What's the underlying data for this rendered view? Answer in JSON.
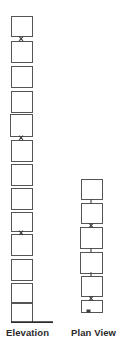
{
  "figure": {
    "type": "engineering-elevation-plan-diagram",
    "background_color": "#ffffff",
    "stroke_color": "#555555",
    "connector_color": "#3a3a3a",
    "label_color": "#2b2b2b",
    "width": 118,
    "height": 343
  },
  "columns": [
    {
      "id": "elevation",
      "label": "Elevation",
      "label_x": 6,
      "label_y": 327,
      "box_count": 13,
      "ground_line": {
        "x1": 11,
        "x2": 53,
        "y": 322,
        "width": 1.6
      },
      "boxes": [
        {
          "x": 11,
          "y": 16,
          "w": 21,
          "h": 20
        },
        {
          "x": 11,
          "y": 41,
          "w": 21,
          "h": 21
        },
        {
          "x": 11,
          "y": 66,
          "w": 21,
          "h": 21
        },
        {
          "x": 11,
          "y": 91,
          "w": 21,
          "h": 21
        },
        {
          "x": 11,
          "y": 114,
          "w": 22,
          "h": 22
        },
        {
          "x": 11,
          "y": 140,
          "w": 21,
          "h": 21
        },
        {
          "x": 11,
          "y": 164,
          "w": 21,
          "h": 21
        },
        {
          "x": 11,
          "y": 188,
          "w": 21,
          "h": 21
        },
        {
          "x": 11,
          "y": 212,
          "w": 21,
          "h": 19
        },
        {
          "x": 11,
          "y": 234,
          "w": 21,
          "h": 21
        },
        {
          "x": 11,
          "y": 259,
          "w": 21,
          "h": 21
        },
        {
          "x": 11,
          "y": 283,
          "w": 21,
          "h": 19
        },
        {
          "x": 11,
          "y": 303,
          "w": 21,
          "h": 19
        }
      ],
      "connectors": [
        {
          "x": 21,
          "y": 38
        },
        {
          "x": 21,
          "y": 137
        },
        {
          "x": 21,
          "y": 232
        }
      ]
    },
    {
      "id": "plan-view",
      "label": "Plan View",
      "label_x": 71,
      "label_y": 327,
      "box_count": 6,
      "ground_line": null,
      "boxes": [
        {
          "x": 81,
          "y": 179,
          "w": 21,
          "h": 20
        },
        {
          "x": 81,
          "y": 203,
          "w": 21,
          "h": 20
        },
        {
          "x": 81,
          "y": 227,
          "w": 22,
          "h": 21
        },
        {
          "x": 81,
          "y": 252,
          "w": 22,
          "h": 21
        },
        {
          "x": 81,
          "y": 276,
          "w": 21,
          "h": 20
        },
        {
          "x": 81,
          "y": 300,
          "w": 21,
          "h": 12
        }
      ],
      "connectors": [
        {
          "x": 91,
          "y": 201
        },
        {
          "x": 91,
          "y": 225
        },
        {
          "x": 91,
          "y": 250
        },
        {
          "x": 91,
          "y": 274
        },
        {
          "x": 91,
          "y": 298
        },
        {
          "x": 88,
          "y": 311
        }
      ]
    }
  ]
}
